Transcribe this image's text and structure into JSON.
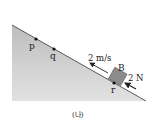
{
  "diagram": {
    "points": [
      {
        "name": "p",
        "label": "p"
      },
      {
        "name": "q",
        "label": "q"
      },
      {
        "name": "r",
        "label": "r"
      }
    ],
    "block": {
      "label": "B"
    },
    "velocity": {
      "label": "2 m/s"
    },
    "force": {
      "label": "2 N"
    },
    "caption": "(나)",
    "colors": {
      "incline": "#c8c8c8",
      "block": "#8c8c8c",
      "line": "#222222"
    }
  }
}
